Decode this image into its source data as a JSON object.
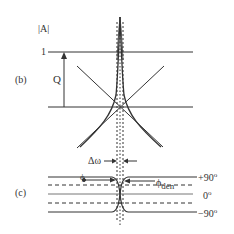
{
  "panel_b": {
    "label": "(b)",
    "y_axis_label": "|A|",
    "level_one_label": "1",
    "gain_label": "Q"
  },
  "panel_c": {
    "label": "(c)",
    "bandwidth_label": "Δω",
    "phi_label": "ϕ",
    "phi_den_label": "ϕ",
    "phi_den_subscript": "den",
    "plus90_label": "+90",
    "zero_label": "0",
    "minus90_label": "−90",
    "degree_symbol": "o"
  },
  "colors": {
    "line": "#333333",
    "background": "#ffffff"
  }
}
